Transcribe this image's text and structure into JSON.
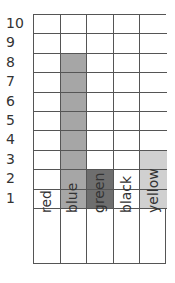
{
  "chart_data": {
    "type": "bar",
    "title": "",
    "xlabel": "",
    "ylabel": "",
    "categories": [
      "red",
      "blue",
      "green",
      "black",
      "yellow"
    ],
    "values": [
      0,
      8,
      2,
      0,
      3
    ],
    "colors": [
      "#ffffff",
      "#a6a6a6",
      "#6e6e6e",
      "#ffffff",
      "#d0d0d0"
    ],
    "ylim": [
      0,
      10
    ],
    "yticks": [
      "1",
      "2",
      "3",
      "4",
      "5",
      "6",
      "7",
      "8",
      "9",
      "10"
    ],
    "grid": true,
    "style": "pictogram grid (block graph)"
  }
}
